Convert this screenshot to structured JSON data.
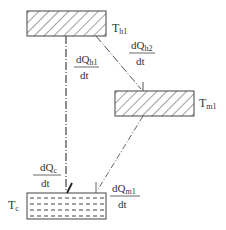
{
  "nodes": {
    "hot": {
      "label": "T",
      "sub": "h1",
      "fill": "hatch"
    },
    "mid": {
      "label": "T",
      "sub": "m1",
      "fill": "hatch"
    },
    "cold": {
      "label": "T",
      "sub": "c",
      "fill": "dashed-liquid"
    }
  },
  "flows": {
    "h1": {
      "num": "dQ",
      "sub": "h1",
      "den": "dt",
      "from": "hot",
      "to": "cold"
    },
    "h2": {
      "num": "dQ",
      "sub": "h2",
      "den": "dt",
      "from": "hot",
      "to": "mid"
    },
    "m1": {
      "num": "dQ",
      "sub": "m1",
      "den": "dt",
      "from": "mid",
      "to": "cold"
    },
    "c": {
      "num": "dQ",
      "sub": "c",
      "den": "dt",
      "to": "cold"
    }
  },
  "colors": {
    "stroke": "#444444",
    "text": "#333333"
  }
}
